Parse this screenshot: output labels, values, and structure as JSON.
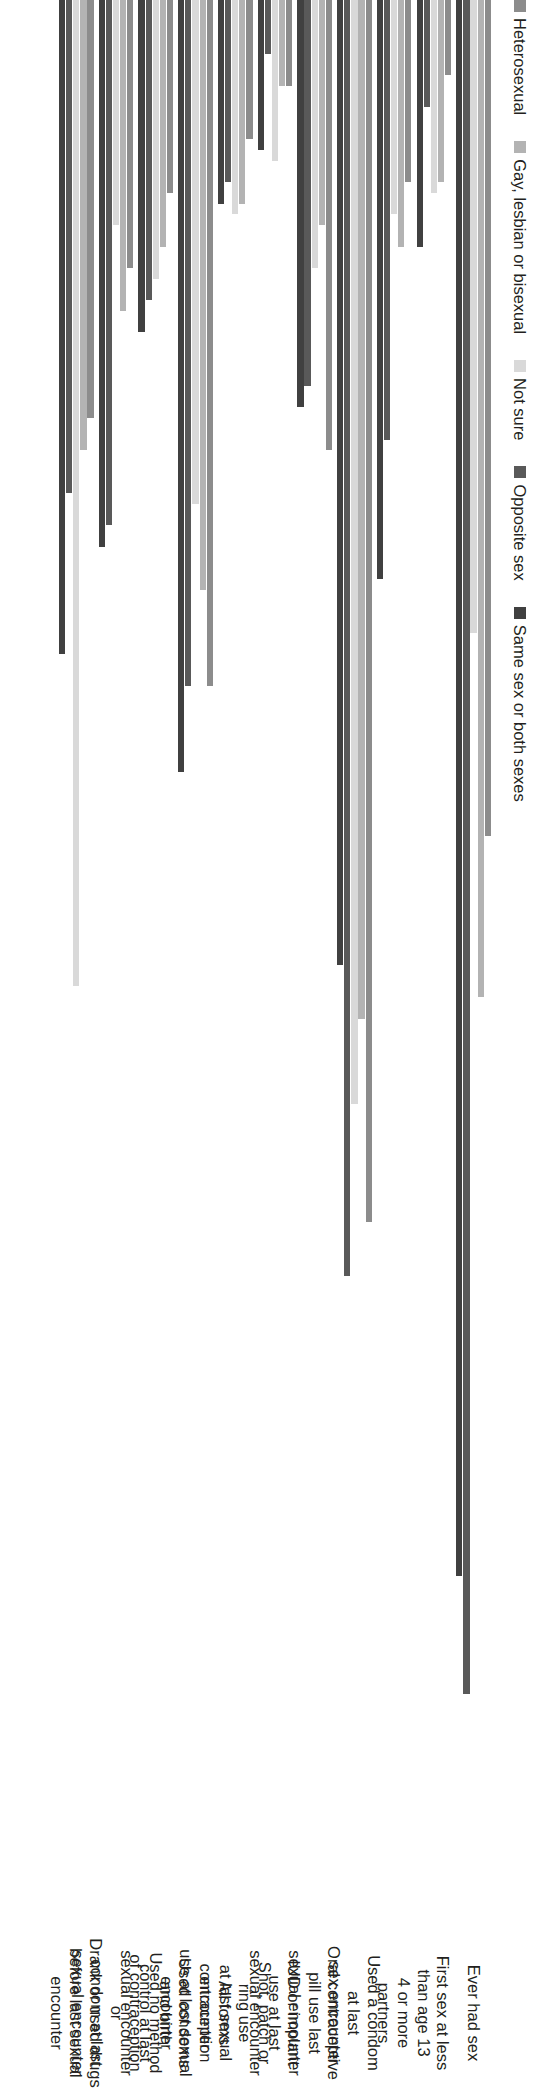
{
  "chart_data": {
    "type": "bar",
    "orientation": "horizontal-rotated",
    "title": "",
    "xlabel": "",
    "ylabel": "",
    "ylim": [
      0,
      90
    ],
    "yticks": [
      0,
      10,
      20,
      30,
      40,
      50,
      60,
      70,
      80,
      90
    ],
    "grid": false,
    "legend_position": "top-left",
    "categories": [
      "Ever had sex",
      "First sex at less\nthan age 13",
      "4 or more\npartners",
      "Used a condom\nat last\nsex encounter",
      "Oral contraceptive\npill use last\nsexual encounter",
      "IUD or implant\nuse at last\nsexual encounter",
      "Shot, patch or\nring use\nat last sexual\nencounter",
      "All forms\ncontraception\nuse at last sexual\nencounter",
      "Used condoms\nand birth\ncontrol at last\nsexual encounter",
      "Used no method\nof contraception\nor\ncondom at last\nsexual encounter",
      "Drank or used drugs\nbefore last sexual\nencounter"
    ],
    "series": [
      {
        "name": "Heterosexual",
        "color": "#8c8c8c",
        "values": [
          39.0,
          3.5,
          8.5,
          57.0,
          21.0,
          4.0,
          6.5,
          32.0,
          9.0,
          12.5,
          19.5
        ]
      },
      {
        "name": "Gay, lesbian or bisexual",
        "color": "#b3b3b3",
        "values": [
          46.5,
          8.5,
          11.5,
          47.5,
          10.5,
          4.0,
          9.5,
          27.5,
          11.5,
          14.5,
          21.0
        ]
      },
      {
        "name": "Not sure",
        "color": "#d9d9d9",
        "values": [
          29.5,
          9.0,
          10.0,
          51.5,
          12.5,
          7.5,
          10.0,
          23.5,
          13.0,
          10.5,
          46.0
        ]
      },
      {
        "name": "Opposite sex",
        "color": "#595959",
        "values": [
          79.0,
          5.0,
          20.5,
          59.5,
          18.0,
          2.5,
          8.5,
          32.0,
          14.0,
          24.5,
          23.0
        ]
      },
      {
        "name": "Same sex or both sexes",
        "color": "#404040",
        "values": [
          73.5,
          11.5,
          27.0,
          45.0,
          19.0,
          7.0,
          9.5,
          36.0,
          15.5,
          25.5,
          30.5
        ]
      }
    ]
  },
  "legend": {
    "items": [
      {
        "label": "Heterosexual",
        "color": "#8c8c8c"
      },
      {
        "label": "Gay, lesbian or bisexual",
        "color": "#b3b3b3"
      },
      {
        "label": "Not sure",
        "color": "#d9d9d9"
      },
      {
        "label": "Opposite sex",
        "color": "#595959"
      },
      {
        "label": "Same sex or both sexes",
        "color": "#404040"
      }
    ]
  }
}
